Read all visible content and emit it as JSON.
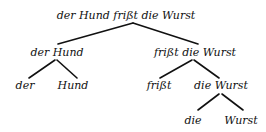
{
  "diagram": {
    "type": "parse-tree",
    "nodes": [
      {
        "id": "root",
        "label": "der Hund frißt die Wurst",
        "children": [
          "np",
          "vp"
        ]
      },
      {
        "id": "np",
        "label": "der Hund",
        "children": [
          "np-det",
          "np-n"
        ]
      },
      {
        "id": "vp",
        "label": "frißt die Wurst",
        "children": [
          "v",
          "obj"
        ]
      },
      {
        "id": "np-det",
        "label": "der",
        "children": []
      },
      {
        "id": "np-n",
        "label": "Hund",
        "children": []
      },
      {
        "id": "v",
        "label": "frißt",
        "children": []
      },
      {
        "id": "obj",
        "label": "die Wurst",
        "children": [
          "obj-det",
          "obj-n"
        ]
      },
      {
        "id": "obj-det",
        "label": "die",
        "children": []
      },
      {
        "id": "obj-n",
        "label": "Wurst",
        "children": []
      }
    ],
    "colors": {
      "ink": "#111111",
      "background": "#ffffff"
    }
  }
}
